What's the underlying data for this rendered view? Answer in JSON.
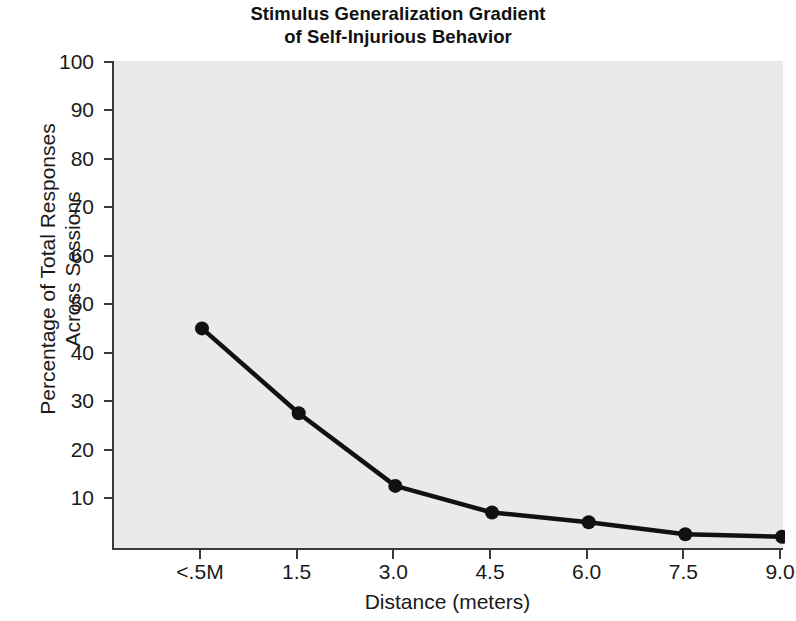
{
  "chart_data": {
    "type": "line",
    "title": "Stimulus Generalization Gradient of Self-Injurious Behavior",
    "title_lines": [
      "Stimulus Generalization Gradient",
      "of Self-Injurious Behavior"
    ],
    "xlabel": "Distance (meters)",
    "ylabel": "Percentage of Total Responses Across Sessions",
    "ylabel_lines": [
      "Percentage of Total Responses",
      "Across Sessions"
    ],
    "categories": [
      "<.5M",
      "1.5",
      "3.0",
      "4.5",
      "6.0",
      "7.5",
      "9.0"
    ],
    "values": [
      45,
      27.5,
      12.5,
      7,
      5,
      2.5,
      2
    ],
    "series": [
      {
        "name": "Percentage of Total Responses Across Sessions",
        "values": [
          45,
          27.5,
          12.5,
          7,
          5,
          2.5,
          2
        ]
      }
    ],
    "yticks": [
      100,
      90,
      80,
      70,
      60,
      50,
      40,
      30,
      20,
      10
    ],
    "ylim": [
      0,
      100
    ],
    "grid": false,
    "legend": "none",
    "marker": "filled-circle",
    "line_color": "#111111",
    "plot_background": "#eaeaea",
    "axis_color": "#3a3a3a"
  },
  "axis": {
    "y_tick_labels": [
      "100",
      "90",
      "80",
      "70",
      "60",
      "50",
      "40",
      "30",
      "20",
      "10"
    ],
    "x_tick_labels": [
      "<.5M",
      "1.5",
      "3.0",
      "4.5",
      "6.0",
      "7.5",
      "9.0"
    ]
  }
}
